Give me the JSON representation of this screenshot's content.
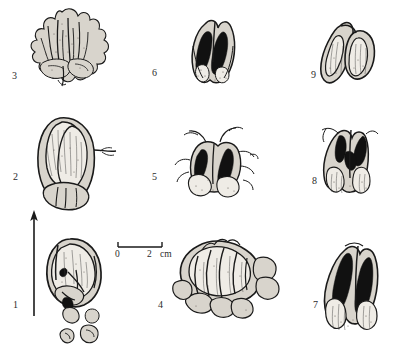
{
  "plate": {
    "background_color": "#ffffff",
    "ink_color": "#1a1a1a",
    "label_color": "#2b2b2b",
    "figure_count": 9
  },
  "scale_bar": {
    "name": "scale-bar",
    "start_label": "0",
    "end_label": "2",
    "unit_label": "cm",
    "x": 118,
    "y": 247,
    "length_px": 44
  },
  "arrow": {
    "name": "orientation-arrow",
    "direction": "up",
    "x": 34,
    "y_top": 212,
    "y_bottom": 316
  },
  "figures": [
    {
      "label": "1",
      "label_x": 13,
      "label_y": 300,
      "cx": 72,
      "cy": 280,
      "type": "valve-open-fragmented"
    },
    {
      "label": "2",
      "label_x": 13,
      "label_y": 172,
      "cx": 65,
      "cy": 158,
      "type": "oval-paired-lobes"
    },
    {
      "label": "3",
      "label_x": 12,
      "label_y": 71,
      "cx": 62,
      "cy": 50,
      "type": "frilled-crested"
    },
    {
      "label": "4",
      "label_x": 158,
      "label_y": 300,
      "cx": 225,
      "cy": 282,
      "type": "multi-lobed-cluster"
    },
    {
      "label": "5",
      "label_x": 152,
      "label_y": 172,
      "cx": 215,
      "cy": 160,
      "type": "tendrilled-pair"
    },
    {
      "label": "6",
      "label_x": 152,
      "label_y": 68,
      "cx": 216,
      "cy": 50,
      "type": "bivalve-dark-interior"
    },
    {
      "label": "7",
      "label_x": 313,
      "label_y": 300,
      "cx": 350,
      "cy": 290,
      "type": "dark-flame-interior"
    },
    {
      "label": "8",
      "label_x": 312,
      "label_y": 176,
      "cx": 348,
      "cy": 158,
      "type": "dark-v-marking"
    },
    {
      "label": "9",
      "label_x": 311,
      "label_y": 70,
      "cx": 350,
      "cy": 52,
      "type": "teardrop-pair"
    }
  ]
}
